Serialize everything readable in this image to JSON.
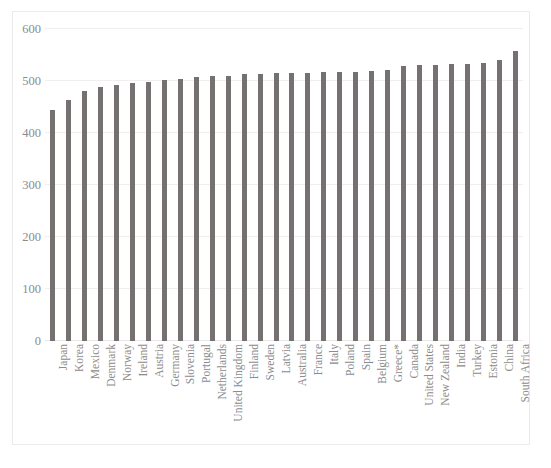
{
  "chart_data": {
    "type": "bar",
    "title": "",
    "subtitle": "",
    "xlabel": "",
    "ylabel": "",
    "ylim": [
      0,
      600
    ],
    "yticks": [
      0,
      100,
      200,
      300,
      400,
      500,
      600
    ],
    "ytick_labels": [
      "0",
      "100",
      "200",
      "300",
      "400",
      "500",
      "600"
    ],
    "grid": true,
    "legend": false,
    "legend_position": "none",
    "bar_color": "#767171",
    "categories": [
      "Japan",
      "Korea",
      "Mexico",
      "Denmark",
      "Norway",
      "Ireland",
      "Austria",
      "Germany",
      "Slovenia",
      "Portugal",
      "Netherlands",
      "United Kingdom",
      "Finland",
      "Sweden",
      "Latvia",
      "Australia",
      "France",
      "Italy",
      "Poland",
      "Spain",
      "Belgium",
      "Greece*",
      "Canada",
      "United States",
      "New Zealand",
      "India",
      "Turkey",
      "Estonia",
      "China",
      "South Africa"
    ],
    "values": [
      444,
      463,
      481,
      489,
      493,
      497,
      499,
      501,
      504,
      508,
      509,
      509,
      513,
      514,
      515,
      516,
      516,
      517,
      518,
      518,
      520,
      521,
      528,
      530,
      531,
      532,
      533,
      535,
      540,
      557
    ],
    "annotations": [
      "Greece* marked with asterisk footnote"
    ]
  },
  "axes": {
    "y_axis_name": "y-axis",
    "x_axis_name": "x-axis"
  }
}
